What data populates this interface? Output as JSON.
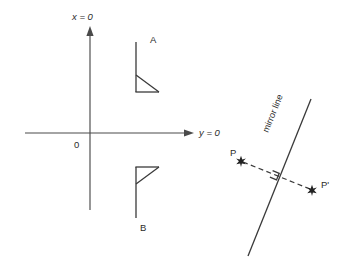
{
  "figure": {
    "width": 349,
    "height": 264,
    "background": "#ffffff",
    "line_color": "#4a4a4a",
    "text_color": "#2b2b2b",
    "marker_color": "#222222"
  },
  "axes": {
    "vertical_label": "x = 0",
    "horizontal_label": "y = 0",
    "origin_label": "0",
    "vertical": {
      "x": 90,
      "y_top": 28,
      "y_bottom": 210
    },
    "horizontal": {
      "y": 133,
      "x_left": 25,
      "x_right": 193
    },
    "vertical_label_pos": {
      "x": 72,
      "y": 20
    },
    "horizontal_label_pos": {
      "x": 199,
      "y": 136
    },
    "origin_label_pos": {
      "x": 74,
      "y": 148
    }
  },
  "shapes": [
    {
      "name": "shape-a",
      "label": "A",
      "label_pos": {
        "x": 150,
        "y": 43
      },
      "vertical": {
        "x": 136,
        "y_top": 42,
        "y_bottom": 92
      },
      "horizontal": {
        "y": 92,
        "x_left": 136,
        "x_right": 159
      },
      "hypotenuse": {
        "x1": 136,
        "y1": 75,
        "x2": 159,
        "y2": 92
      }
    },
    {
      "name": "shape-b",
      "label": "B",
      "label_pos": {
        "x": 140,
        "y": 231
      },
      "vertical": {
        "x": 136,
        "y_top": 167,
        "y_bottom": 218
      },
      "horizontal": {
        "y": 167,
        "x_left": 136,
        "x_right": 159
      },
      "hypotenuse": {
        "x1": 136,
        "y1": 184,
        "x2": 159,
        "y2": 167
      }
    }
  ],
  "mirror_diagram": {
    "mirror_label": "mirror line",
    "mirror_label_pos": {
      "x": 268,
      "y": 133
    },
    "mirror_label_rotation": -63,
    "mirror_line": {
      "x1": 248,
      "y1": 256,
      "x2": 311,
      "y2": 99
    },
    "point_p": {
      "label": "P",
      "label_pos": {
        "x": 230,
        "y": 156
      },
      "marker": {
        "x": 241,
        "y": 161
      }
    },
    "point_p_prime": {
      "label": "P'",
      "label_pos": {
        "x": 321,
        "y": 188
      },
      "marker": {
        "x": 312,
        "y": 190
      }
    },
    "connector": {
      "x1": 241,
      "y1": 161,
      "x2": 312,
      "y2": 190
    },
    "right_angle_mark": {
      "x": 272,
      "y": 172,
      "size": 8
    }
  }
}
